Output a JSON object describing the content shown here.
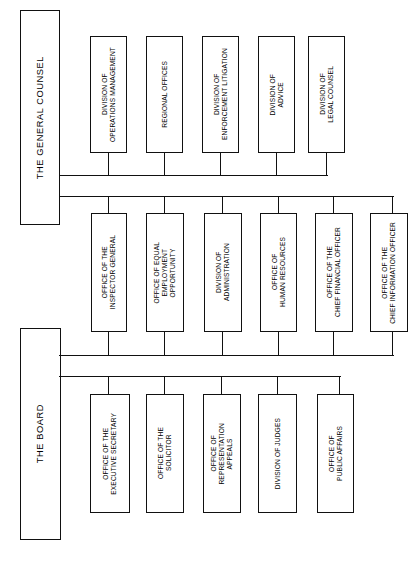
{
  "diagram": {
    "orientation": "rotated-90",
    "line_color": "#111111",
    "box_fill": "#ffffff",
    "roots": [
      {
        "id": "general-counsel",
        "label": "THE GENERAL COUNSEL",
        "groups": [
          {
            "id": "gc-row-1",
            "children": [
              {
                "id": "division-of-operations-management",
                "label": "DIVISION OF\nOPERATIONS MANAGEMENT"
              },
              {
                "id": "regional-offices",
                "label": "REGIONAL OFFICES"
              },
              {
                "id": "division-of-enforcement-litigation",
                "label": "DIVISION OF\nENFORCEMENT LITIGATION"
              },
              {
                "id": "division-of-advice",
                "label": "DIVISION OF\nADVICE"
              },
              {
                "id": "division-of-legal-counsel",
                "label": "DIVISION OF\nLEGAL COUNSEL"
              }
            ]
          },
          {
            "id": "gc-row-2",
            "children": [
              {
                "id": "office-of-the-inspector-general",
                "label": "OFFICE OF THE\nINSPECTOR GENERAL"
              },
              {
                "id": "office-of-equal-employment-opportunity",
                "label": "OFFICE OF EQUAL\nEMPLOYMENT\nOPPORTUNITY"
              },
              {
                "id": "division-of-administration",
                "label": "DIVISION OF\nADMINISTRATION"
              },
              {
                "id": "office-of-human-resources",
                "label": "OFFICE OF\nHUMAN RESOURCES"
              },
              {
                "id": "office-of-the-chief-financial-officer",
                "label": "OFFICE OF THE\nCHIEF FINANCIAL OFFICER"
              },
              {
                "id": "office-of-the-chief-information-officer",
                "label": "OFFICE OF THE\nCHIEF INFORMATION OFFICER"
              }
            ]
          }
        ]
      },
      {
        "id": "the-board",
        "label": "THE BOARD",
        "groups": [
          {
            "id": "board-row-1",
            "children": [
              {
                "id": "office-of-the-executive-secretary",
                "label": "OFFICE OF THE\nEXECUTIVE SECRETARY"
              },
              {
                "id": "office-of-the-solicitor",
                "label": "OFFICE OF THE\nSOLICITOR"
              },
              {
                "id": "office-of-representation-appeals",
                "label": "OFFICE OF\nREPRESENTATION\nAPPEALS"
              },
              {
                "id": "division-of-judges",
                "label": "DIVISION OF JUDGES"
              },
              {
                "id": "office-of-public-affairs",
                "label": "OFFICE OF\nPUBLIC AFFAIRS"
              }
            ]
          }
        ]
      }
    ]
  }
}
